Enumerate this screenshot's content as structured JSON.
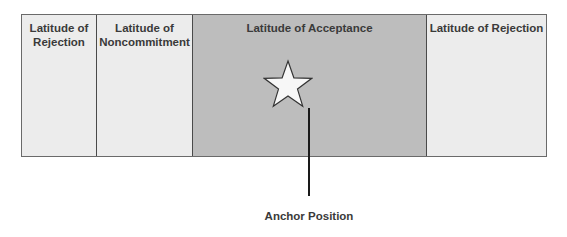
{
  "diagram": {
    "zones": [
      {
        "label": "Latitude of\nRejection",
        "shade": "light",
        "color": "#ececec"
      },
      {
        "label": "Latitude of\nNoncommitment",
        "shade": "light",
        "color": "#ececec"
      },
      {
        "label": "Latitude of Acceptance",
        "shade": "dark",
        "color": "#bdbdbd"
      },
      {
        "label": "Latitude of Rejection",
        "shade": "light",
        "color": "#ececec"
      }
    ],
    "marker": {
      "icon": "star-icon",
      "label": "Anchor Position"
    }
  }
}
